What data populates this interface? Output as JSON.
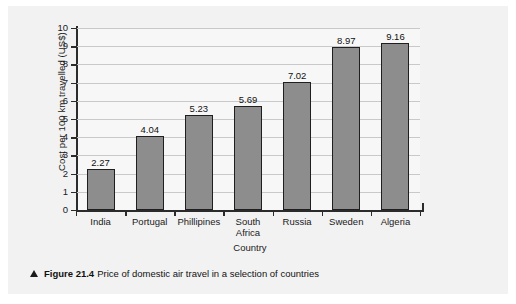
{
  "caption": {
    "marker": "triangle-up",
    "figure_number": "Figure 21.4",
    "text": "Price of domestic air travel in a selection of countries"
  },
  "chart_data": {
    "type": "bar",
    "title": "",
    "xlabel": "Country",
    "ylabel": "Cost per 100 km travelled (US$)",
    "categories": [
      "India",
      "Portugal",
      "Phillipines",
      "South\nAfrica",
      "Russia",
      "Sweden",
      "Algeria"
    ],
    "values": [
      2.27,
      4.04,
      5.23,
      5.69,
      7.02,
      8.97,
      9.16
    ],
    "value_labels": [
      "2.27",
      "4.04",
      "5.23",
      "5.69",
      "7.02",
      "8.97",
      "9.16"
    ],
    "ylim": [
      0,
      10
    ],
    "yticks": [
      0,
      1,
      2,
      3,
      4,
      5,
      6,
      7,
      8,
      9,
      10
    ],
    "ytick_labels": [
      "0",
      "1",
      "2",
      "3",
      "4",
      "5",
      "6",
      "7",
      "8",
      "9",
      "10"
    ],
    "grid": true,
    "grid_axis": "y",
    "legend": false,
    "bar_color": "#8d8d8d",
    "bar_edge_color": "#1f1f1f",
    "plot_background": "#f7f7f7",
    "panel_background": "#f2f2f2"
  }
}
